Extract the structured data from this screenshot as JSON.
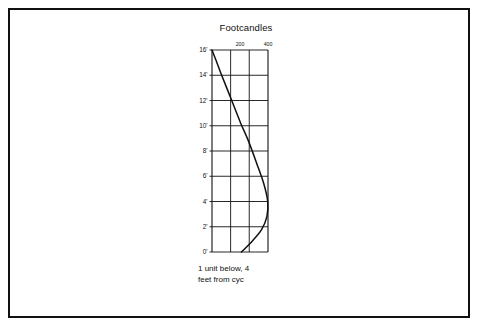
{
  "page": {
    "background_color": "#ffffff",
    "frame_color": "#111111"
  },
  "figure": {
    "title": "Footcandles",
    "caption_line_1": "1 unit below, 4",
    "caption_line_2": "feet from cyc"
  },
  "chart_data": {
    "type": "line",
    "title": "Footcandles",
    "xlabel": "Footcandles",
    "ylabel": "",
    "orientation": "vertical-profile",
    "axis_position": {
      "x_axis": "top",
      "y_axis": "left"
    },
    "grid": true,
    "legend": false,
    "xlim": [
      0,
      400
    ],
    "ylim": [
      0,
      16
    ],
    "x_ticks": [
      200,
      400
    ],
    "x_tick_labels": [
      "200",
      "400"
    ],
    "x_gridlines": [
      0,
      133,
      266,
      400
    ],
    "y_ticks": [
      0,
      2,
      4,
      6,
      8,
      10,
      12,
      14,
      16
    ],
    "y_tick_labels": [
      "0'",
      "2'",
      "4'",
      "6'",
      "8'",
      "10'",
      "12'",
      "14'",
      "16'"
    ],
    "series": [
      {
        "name": "footcandles-profile",
        "color": "#111111",
        "x": [
          0,
          28,
          62,
          105,
          155,
          205,
          260,
          320,
          370,
          398,
          392,
          355,
          290,
          210
        ],
        "y": [
          16.0,
          15.2,
          14.2,
          13.0,
          11.6,
          10.2,
          8.8,
          7.0,
          5.4,
          4.0,
          2.8,
          1.8,
          0.9,
          0.0
        ]
      }
    ]
  }
}
